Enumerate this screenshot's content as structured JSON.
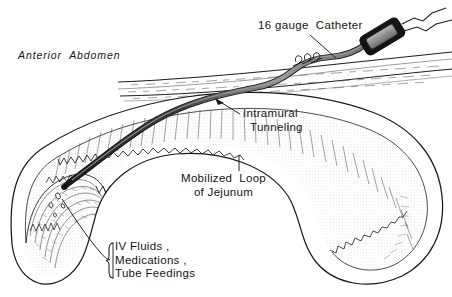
{
  "figure": {
    "background_color": "#ffffff",
    "ink_color": "#141414",
    "catheter_color": "#2b2b2b",
    "catheter_highlight_color": "#8d8d8d",
    "hub_fill_color": "#9a9a9a",
    "tissue_shading_color": "#9d9d9d"
  },
  "labels": {
    "anterior_abdomen": "Anterior  Abdomen",
    "catheter": "16 gauge  Catheter",
    "intramural_line1": "Intramural",
    "intramural_line2": "Tunneling",
    "mobilized_line1": "Mobilized  Loop",
    "mobilized_line2": "of Jejunum",
    "iv_line1": "IV Fluids ,",
    "iv_line2": "Medications ,",
    "iv_line3": "Tube Feedings"
  },
  "parts": {
    "abdominal_wall": "anterior-abdominal-wall",
    "jejunal_loop": "mobilized-loop-of-jejunum",
    "mucosal_folds": "jejunal-mucosal-folds",
    "catheter_tube": "16-gauge-catheter-tube",
    "catheter_hub": "catheter-hub-connector",
    "sutures": "skin-securing-sutures",
    "catheter_tip": "catheter-tip-in-lumen",
    "infusion_droplets": "infusate-droplets",
    "leader_catheter": "leader-line-catheter",
    "leader_intramural": "leader-line-intramural",
    "leader_mobilized": "leader-line-mobilized-loop",
    "leader_iv": "leader-line-iv-fluids",
    "bracket_iv": "brace-bracket-iv-fluids"
  }
}
